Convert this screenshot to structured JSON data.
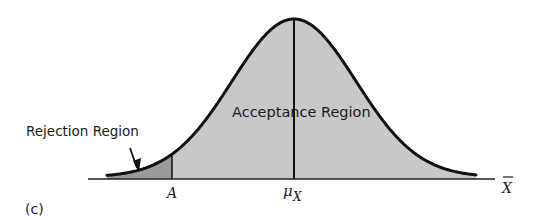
{
  "figure": {
    "panel_label": "(c)",
    "type": "normal-distribution-one-tailed-test"
  },
  "labels": {
    "rejection_region": "Rejection Region",
    "acceptance_region": "Acceptance Region",
    "critical_value": "A",
    "mean_symbol": "μ",
    "mean_subscript": "X",
    "axis_variable": "X"
  },
  "colors": {
    "curve": "#111111",
    "acceptance_fill": "#c8c8c8",
    "rejection_fill": "#9a9a9a",
    "axis": "#222222",
    "background": "#ffffff"
  },
  "geometry": {
    "axis_y": 179,
    "axis_x_start": 88,
    "axis_x_end": 495,
    "mean_x": 294,
    "peak_y": 19,
    "sigma_px": 62,
    "curve_x_start": 107,
    "curve_x_end": 476,
    "critical_x": 172
  }
}
